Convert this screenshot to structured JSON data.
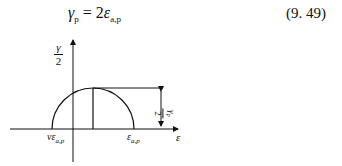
{
  "equation": {
    "lhs": "γ",
    "lhs_sub": "p",
    "equals": " = 2",
    "rhs": "ε",
    "rhs_sub": "a,p",
    "number": "(9. 49)"
  },
  "diagram": {
    "y_axis_label_num": "γ",
    "y_axis_label_den": "2",
    "x_axis_label": "ε",
    "left_point_label": "νε",
    "left_point_sub": "a,p",
    "right_point_label": "ε",
    "right_point_sub": "a,p",
    "height_label_num": "γ",
    "height_label_sub": "p",
    "height_label_den": "2"
  }
}
